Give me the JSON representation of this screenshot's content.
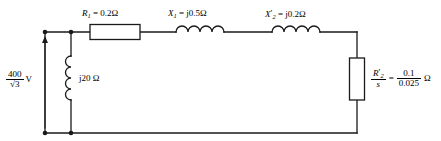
{
  "diagram": {
    "stroke_color": "#1a1a1a",
    "background": "#ffffff"
  },
  "source": {
    "name": "voltage-source",
    "numerator": "400",
    "denominator": "√3",
    "unit": "V",
    "arrow_direction": "up"
  },
  "series_elements": [
    {
      "symbol": "R",
      "subscript": "1",
      "prime": "",
      "equals": "=",
      "value": "0.2",
      "unit": "Ω",
      "type": "resistor",
      "label": "R1 = 0.2 Ω"
    },
    {
      "symbol": "X",
      "subscript": "1",
      "prime": "",
      "equals": "=",
      "value": "j0.5",
      "unit": "Ω",
      "type": "inductor",
      "label": "X1 = j0.5 Ω"
    },
    {
      "symbol": "X",
      "subscript": "2",
      "prime": "′",
      "equals": "=",
      "value": "j0.2",
      "unit": "Ω",
      "type": "inductor",
      "label": "X2' = j0.2 Ω"
    }
  ],
  "shunt_branch": {
    "name": "magnetizing-reactance",
    "type": "inductor",
    "value": "j20",
    "unit": "Ω",
    "label": "j20 Ω"
  },
  "load_branch": {
    "name": "rotor-resistance",
    "type": "resistor",
    "symbol": "R",
    "subscript": "2",
    "prime": "′",
    "slip_symbol": "s",
    "equals": "=",
    "value_numerator": "0.1",
    "value_denominator": "0.025",
    "unit": "Ω",
    "label": "R2'/s = 0.1/0.025 Ω"
  },
  "nodes": [
    {
      "name": "top-left-node",
      "x": 45,
      "y": 32
    },
    {
      "name": "top-shunt-node",
      "x": 71,
      "y": 32
    },
    {
      "name": "bottom-left-node",
      "x": 45,
      "y": 133
    },
    {
      "name": "bottom-shunt-node",
      "x": 71,
      "y": 133
    }
  ]
}
